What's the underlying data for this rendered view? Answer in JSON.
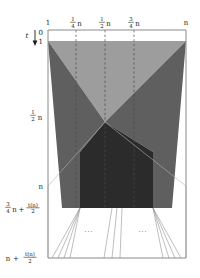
{
  "figure": {
    "colors": {
      "background": "#ffffff",
      "frame": "#8a8a8a",
      "light_wedge": "#9d9d9d",
      "mid_wedge": "#5f5f5f",
      "dark_region": "#2b2b2b",
      "dashed_gridline": "#4a4a4a",
      "fan_line": "#9a9a9a",
      "text": "#1a1a1a"
    }
  },
  "x_axis": {
    "name": "index-axis",
    "position": "top",
    "ticks": [
      {
        "id": "x-tick-1",
        "label": "1",
        "numerator": "",
        "denominator": "",
        "suffix": "",
        "x_px": 48,
        "dashed": false
      },
      {
        "id": "x-tick-quarter",
        "label": "",
        "numerator": "1",
        "denominator": "4",
        "suffix": "n",
        "x_px": 76,
        "dashed": true
      },
      {
        "id": "x-tick-half",
        "label": "",
        "numerator": "1",
        "denominator": "2",
        "suffix": "n",
        "x_px": 105,
        "dashed": true
      },
      {
        "id": "x-tick-threequarter",
        "label": "",
        "numerator": "3",
        "denominator": "4",
        "suffix": "n",
        "x_px": 134,
        "dashed": true
      },
      {
        "id": "x-tick-n",
        "label": "n",
        "numerator": "",
        "denominator": "",
        "suffix": "",
        "x_px": 186,
        "dashed": false
      }
    ]
  },
  "y_axis": {
    "name": "time-axis",
    "position": "left",
    "axis_symbol": "t",
    "arrow_direction": "down",
    "ticks": [
      {
        "id": "y-tick-0",
        "label": "0",
        "y_px": 33
      },
      {
        "id": "y-tick-1",
        "label": "1",
        "y_px": 41
      },
      {
        "id": "y-tick-halfn",
        "label": "",
        "numerator": "1",
        "denominator": "2",
        "suffix": "n",
        "y_px": 116
      },
      {
        "id": "y-tick-n",
        "label": "n",
        "y_px": 186
      },
      {
        "id": "y-tick-threequarter-plus",
        "label": "",
        "y_px": 208,
        "compound": {
          "lead_numerator": "3",
          "lead_denominator": "4",
          "lead_suffix": "n",
          "operator": "+",
          "tail_numerator": "t(n)",
          "tail_denominator": "2"
        }
      },
      {
        "id": "y-tick-n-plus",
        "label": "",
        "y_px": 258,
        "compound": {
          "lead_numerator": "",
          "lead_denominator": "",
          "lead_suffix": "n",
          "operator": "+",
          "tail_numerator": "t(n)",
          "tail_denominator": "2"
        }
      }
    ]
  },
  "regions": [
    {
      "id": "light-wedge",
      "name": "upper-light-triangle",
      "shade": "#9d9d9d"
    },
    {
      "id": "mid-wedge-left",
      "name": "left-mid-wedge",
      "shade": "#5f5f5f"
    },
    {
      "id": "mid-wedge-right",
      "name": "right-mid-wedge",
      "shade": "#5f5f5f"
    },
    {
      "id": "dark-column",
      "name": "lower-dark-column",
      "shade": "#2b2b2b"
    }
  ],
  "fan": {
    "name": "bottom-fan",
    "left_group_lines": 4,
    "center_group_lines": 3,
    "right_group_lines": 4,
    "ellipsis_left": "...",
    "ellipsis_right": "..."
  },
  "plot_box": {
    "left_px": 48,
    "right_px": 186,
    "top_px": 30,
    "bottom_px": 262
  }
}
